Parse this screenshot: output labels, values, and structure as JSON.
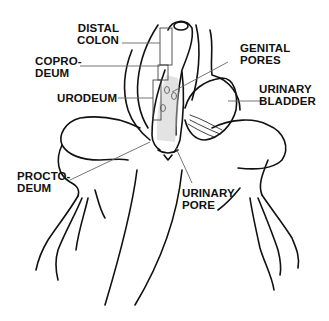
{
  "diagram": {
    "labels": [
      {
        "id": "distal-colon",
        "lines": [
          "DISTAL",
          "COLON"
        ],
        "align": "right"
      },
      {
        "id": "coprodeum",
        "lines": [
          "COPRO-",
          "DEUM"
        ],
        "align": "left"
      },
      {
        "id": "urodeum",
        "lines": [
          "URODEUM"
        ],
        "align": "right"
      },
      {
        "id": "genital-pores",
        "lines": [
          "GENITAL",
          "PORES"
        ],
        "align": "left"
      },
      {
        "id": "urinary-bladder",
        "lines": [
          "URINARY",
          "BLADDER"
        ],
        "align": "left"
      },
      {
        "id": "proctodeum",
        "lines": [
          "PROCTO-",
          "DEUM"
        ],
        "align": "left"
      },
      {
        "id": "urinary-pore",
        "lines": [
          "URINARY",
          "PORE"
        ],
        "align": "left"
      }
    ]
  },
  "colors": {
    "background": "#ffffff",
    "ink": "#111111",
    "leader": "#777777",
    "stipple": "#9a9a9a"
  }
}
